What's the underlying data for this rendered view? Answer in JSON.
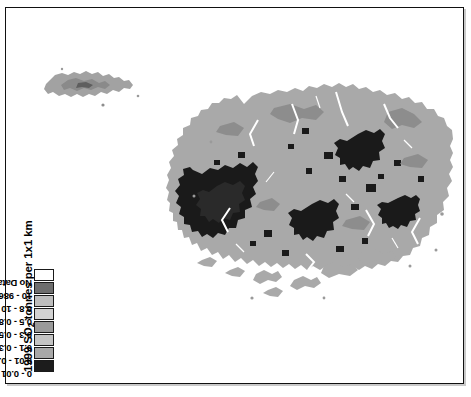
{
  "figure": {
    "border_color": "#111111",
    "background_color": "#ffffff"
  },
  "legend": {
    "title_prefix": "1999 SO",
    "title_subscript": "2",
    "title_suffix": " tonnes per 1x1 km",
    "title_full": "1999 SO2 tonnes per 1x1 km",
    "orientation": "vertical-rotated-90",
    "entries": [
      {
        "label": "0 - 0.01",
        "color": "#1c1c1c"
      },
      {
        "label": "0.01 - 0.1",
        "color": "#a8a8a8"
      },
      {
        "label": "0.1 - 0.3",
        "color": "#c4c4c4"
      },
      {
        "label": "0.3 - 0.5",
        "color": "#9a9a9a"
      },
      {
        "label": "0.5 - 0.8",
        "color": "#d2d2d2"
      },
      {
        "label": "0.8 - 10",
        "color": "#bdbdbd"
      },
      {
        "label": "10 - 98630",
        "color": "#6e6e6e"
      },
      {
        "label": "No Data",
        "color": "#ffffff"
      }
    ]
  },
  "map": {
    "name": "so2-emissions-raster-map",
    "description": "Greyscale raster map of an island group showing 1999 SO2 emission density",
    "land_fill": "#a9a9a9",
    "high_value_fill": "#1a1a1a",
    "mid_value_fill": "#8d8d8d",
    "background": "#ffffff"
  }
}
